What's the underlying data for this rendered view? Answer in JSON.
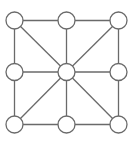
{
  "diagram": {
    "type": "graph",
    "style": {
      "stroke": "#6a6a6a",
      "node_fill": "#ffffff",
      "stroke_width": 1.3,
      "node_radius": 8.5
    },
    "nodes": [
      {
        "id": "n00",
        "x": 14.5,
        "y": 20.5
      },
      {
        "id": "n01",
        "x": 66.5,
        "y": 20.5
      },
      {
        "id": "n02",
        "x": 118.5,
        "y": 20.5
      },
      {
        "id": "n10",
        "x": 14.5,
        "y": 72
      },
      {
        "id": "n11",
        "x": 66.5,
        "y": 72
      },
      {
        "id": "n12",
        "x": 118.5,
        "y": 72
      },
      {
        "id": "n20",
        "x": 14.5,
        "y": 124.5
      },
      {
        "id": "n21",
        "x": 66.5,
        "y": 124.5
      },
      {
        "id": "n22",
        "x": 118.5,
        "y": 124.5
      }
    ],
    "edges": [
      [
        "n00",
        "n01"
      ],
      [
        "n01",
        "n02"
      ],
      [
        "n10",
        "n11"
      ],
      [
        "n11",
        "n12"
      ],
      [
        "n20",
        "n21"
      ],
      [
        "n21",
        "n22"
      ],
      [
        "n00",
        "n10"
      ],
      [
        "n10",
        "n20"
      ],
      [
        "n01",
        "n11"
      ],
      [
        "n11",
        "n21"
      ],
      [
        "n02",
        "n12"
      ],
      [
        "n12",
        "n22"
      ],
      [
        "n00",
        "n11"
      ],
      [
        "n02",
        "n11"
      ],
      [
        "n20",
        "n11"
      ],
      [
        "n22",
        "n11"
      ]
    ]
  }
}
